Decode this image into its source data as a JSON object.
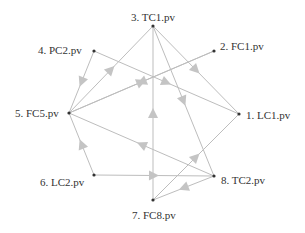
{
  "diagram": {
    "type": "directed-graph",
    "layout": "circular",
    "colors": {
      "edge": "#bdbdbd",
      "arrow": "#c4c4c4",
      "node": "#333333",
      "label": "#333333",
      "background": "#ffffff"
    },
    "nodes": [
      {
        "id": "n1",
        "label": "1. LC1.pv",
        "x": 239,
        "y": 114
      },
      {
        "id": "n2",
        "label": "2. FC1.pv",
        "x": 214,
        "y": 51
      },
      {
        "id": "n3",
        "label": "3. TC1.pv",
        "x": 153,
        "y": 26
      },
      {
        "id": "n4",
        "label": "4. PC2.pv",
        "x": 94,
        "y": 51
      },
      {
        "id": "n5",
        "label": "5. FC5.pv",
        "x": 69,
        "y": 113
      },
      {
        "id": "n6",
        "label": "6. LC2.pv",
        "x": 94,
        "y": 175
      },
      {
        "id": "n7",
        "label": "7. FC8.pv",
        "x": 153,
        "y": 200
      },
      {
        "id": "n8",
        "label": "8. TC2.pv",
        "x": 214,
        "y": 176
      }
    ],
    "edges": [
      {
        "from": "n5",
        "to": "n3"
      },
      {
        "from": "n4",
        "to": "n1"
      },
      {
        "from": "n5",
        "to": "n2"
      },
      {
        "from": "n2",
        "to": "n5"
      },
      {
        "from": "n3",
        "to": "n8"
      },
      {
        "from": "n3",
        "to": "n1"
      },
      {
        "from": "n7",
        "to": "n3"
      },
      {
        "from": "n8",
        "to": "n5"
      },
      {
        "from": "n6",
        "to": "n8"
      },
      {
        "from": "n6",
        "to": "n5"
      },
      {
        "from": "n8",
        "to": "n7"
      },
      {
        "from": "n7",
        "to": "n1"
      },
      {
        "from": "n4",
        "to": "n5"
      }
    ]
  }
}
